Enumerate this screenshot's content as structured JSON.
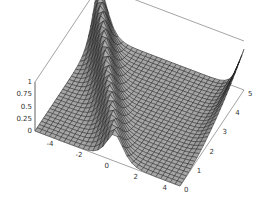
{
  "chart_data": {
    "type": "surface3d",
    "title": "",
    "xlabel": "",
    "ylabel": "",
    "zlabel": "",
    "x_range": [
      -5,
      5
    ],
    "y_range": [
      0,
      5
    ],
    "z_range": [
      0,
      1
    ],
    "x_ticks": [
      "-4",
      "-2",
      "0",
      "2",
      "4"
    ],
    "y_ticks": [
      "0",
      "1",
      "2",
      "3",
      "4",
      "5"
    ],
    "z_ticks": [
      "0",
      "0.25",
      "0.5",
      "0.75",
      "1"
    ],
    "grid_resolution": [
      30,
      30
    ],
    "surface_color": "#8c8c8c",
    "mesh_color": "#1a1a1a",
    "box_color": "#666666"
  }
}
